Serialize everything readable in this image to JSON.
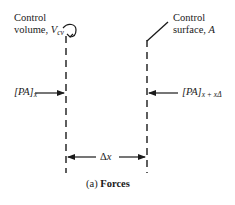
{
  "diagram": {
    "control_volume_label": {
      "line1": "Control",
      "line2": "volume, ",
      "symbol": "V",
      "subscript": "cv"
    },
    "control_surface_label": {
      "line1": "Control",
      "line2": "surface, ",
      "symbol": "A"
    },
    "force_left": {
      "text": "[PA]",
      "subscript": "x"
    },
    "force_right": {
      "text": "[PA]",
      "subscript": "x + xΔ"
    },
    "spacing_label": {
      "delta": "Δ",
      "var": "x"
    },
    "caption": {
      "prefix": "(a)",
      "title": "Forces"
    },
    "colors": {
      "line": "#1a1a1a",
      "background": "#ffffff"
    }
  }
}
